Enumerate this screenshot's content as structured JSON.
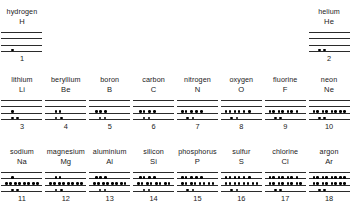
{
  "diagram": {
    "levels_per_element": 4,
    "rows": [
      {
        "row_index": 1,
        "elements": [
          {
            "name": "hydrogen",
            "symbol": "H",
            "number": "1",
            "column": 0,
            "electrons_per_level_bottom_up": [
              1,
              0,
              0,
              0
            ],
            "dot_groups_bottom_up": [
              [
                1
              ],
              [],
              [],
              []
            ]
          },
          {
            "name": "helium",
            "symbol": "He",
            "number": "2",
            "column": 7,
            "electrons_per_level_bottom_up": [
              2,
              0,
              0,
              0
            ],
            "dot_groups_bottom_up": [
              [
                1,
                1
              ],
              [],
              [],
              []
            ]
          }
        ]
      },
      {
        "row_index": 2,
        "elements": [
          {
            "name": "lithium",
            "symbol": "Li",
            "number": "3",
            "electrons_per_level_bottom_up": [
              2,
              1,
              0,
              0
            ],
            "dot_groups_bottom_up": [
              [
                1,
                1
              ],
              [
                1
              ],
              [],
              []
            ]
          },
          {
            "name": "beryllium",
            "symbol": "Be",
            "number": "4",
            "electrons_per_level_bottom_up": [
              2,
              2,
              0,
              0
            ],
            "dot_groups_bottom_up": [
              [
                1,
                1
              ],
              [
                2
              ],
              [],
              []
            ]
          },
          {
            "name": "boron",
            "symbol": "B",
            "number": "5",
            "electrons_per_level_bottom_up": [
              2,
              3,
              0,
              0
            ],
            "dot_groups_bottom_up": [
              [
                1,
                1
              ],
              [
                2,
                1
              ],
              [],
              []
            ]
          },
          {
            "name": "carbon",
            "symbol": "C",
            "number": "6",
            "electrons_per_level_bottom_up": [
              2,
              4,
              0,
              0
            ],
            "dot_groups_bottom_up": [
              [
                1,
                1
              ],
              [
                2,
                1,
                1
              ],
              [],
              []
            ]
          },
          {
            "name": "nitrogen",
            "symbol": "N",
            "number": "7",
            "electrons_per_level_bottom_up": [
              2,
              5,
              0,
              0
            ],
            "dot_groups_bottom_up": [
              [
                1,
                1
              ],
              [
                2,
                1,
                1,
                1
              ],
              [],
              []
            ]
          },
          {
            "name": "oxygen",
            "symbol": "O",
            "number": "8",
            "electrons_per_level_bottom_up": [
              2,
              6,
              0,
              0
            ],
            "dot_groups_bottom_up": [
              [
                1,
                1
              ],
              [
                2,
                2,
                1,
                1
              ],
              [],
              []
            ]
          },
          {
            "name": "fluorine",
            "symbol": "F",
            "number": "9",
            "electrons_per_level_bottom_up": [
              2,
              7,
              0,
              0
            ],
            "dot_groups_bottom_up": [
              [
                1,
                1
              ],
              [
                2,
                2,
                2,
                1
              ],
              [],
              []
            ]
          },
          {
            "name": "neon",
            "symbol": "Ne",
            "number": "10",
            "electrons_per_level_bottom_up": [
              2,
              8,
              0,
              0
            ],
            "dot_groups_bottom_up": [
              [
                1,
                1
              ],
              [
                2,
                2,
                2,
                2
              ],
              [],
              []
            ]
          }
        ]
      },
      {
        "row_index": 3,
        "elements": [
          {
            "name": "sodium",
            "symbol": "Na",
            "number": "11",
            "electrons_per_level_bottom_up": [
              2,
              8,
              1,
              0
            ],
            "dot_groups_bottom_up": [
              [
                1,
                1
              ],
              [
                2,
                2,
                2,
                2
              ],
              [
                1
              ],
              []
            ]
          },
          {
            "name": "magnesium",
            "symbol": "Mg",
            "number": "12",
            "electrons_per_level_bottom_up": [
              2,
              8,
              2,
              0
            ],
            "dot_groups_bottom_up": [
              [
                1,
                1
              ],
              [
                2,
                2,
                2,
                2
              ],
              [
                2
              ],
              []
            ]
          },
          {
            "name": "aluminium",
            "symbol": "Al",
            "number": "13",
            "electrons_per_level_bottom_up": [
              2,
              8,
              3,
              0
            ],
            "dot_groups_bottom_up": [
              [
                1,
                1
              ],
              [
                2,
                2,
                2,
                2
              ],
              [
                2,
                1
              ],
              []
            ]
          },
          {
            "name": "silicon",
            "symbol": "Si",
            "number": "14",
            "electrons_per_level_bottom_up": [
              2,
              8,
              4,
              0
            ],
            "dot_groups_bottom_up": [
              [
                1,
                1
              ],
              [
                2,
                2,
                2,
                2
              ],
              [
                2,
                1,
                1
              ],
              []
            ]
          },
          {
            "name": "phosphorus",
            "symbol": "P",
            "number": "15",
            "electrons_per_level_bottom_up": [
              2,
              8,
              5,
              0
            ],
            "dot_groups_bottom_up": [
              [
                1,
                1
              ],
              [
                2,
                2,
                2,
                2
              ],
              [
                2,
                1,
                1,
                1
              ],
              []
            ]
          },
          {
            "name": "sulfur",
            "symbol": "S",
            "number": "16",
            "electrons_per_level_bottom_up": [
              2,
              8,
              6,
              0
            ],
            "dot_groups_bottom_up": [
              [
                1,
                1
              ],
              [
                2,
                2,
                2,
                2
              ],
              [
                2,
                2,
                1,
                1
              ],
              []
            ]
          },
          {
            "name": "chlorine",
            "symbol": "Cl",
            "number": "17",
            "electrons_per_level_bottom_up": [
              2,
              8,
              7,
              0
            ],
            "dot_groups_bottom_up": [
              [
                1,
                1
              ],
              [
                2,
                2,
                2,
                2
              ],
              [
                2,
                2,
                2,
                1
              ],
              []
            ]
          },
          {
            "name": "argon",
            "symbol": "Ar",
            "number": "18",
            "electrons_per_level_bottom_up": [
              2,
              8,
              8,
              0
            ],
            "dot_groups_bottom_up": [
              [
                1,
                1
              ],
              [
                2,
                2,
                2,
                2
              ],
              [
                2,
                2,
                2,
                2
              ],
              []
            ]
          }
        ]
      }
    ],
    "colors": {
      "background": "#ffffff",
      "line": "#2b2b2b",
      "dot": "#000000",
      "text": "#1a1a1a"
    }
  }
}
